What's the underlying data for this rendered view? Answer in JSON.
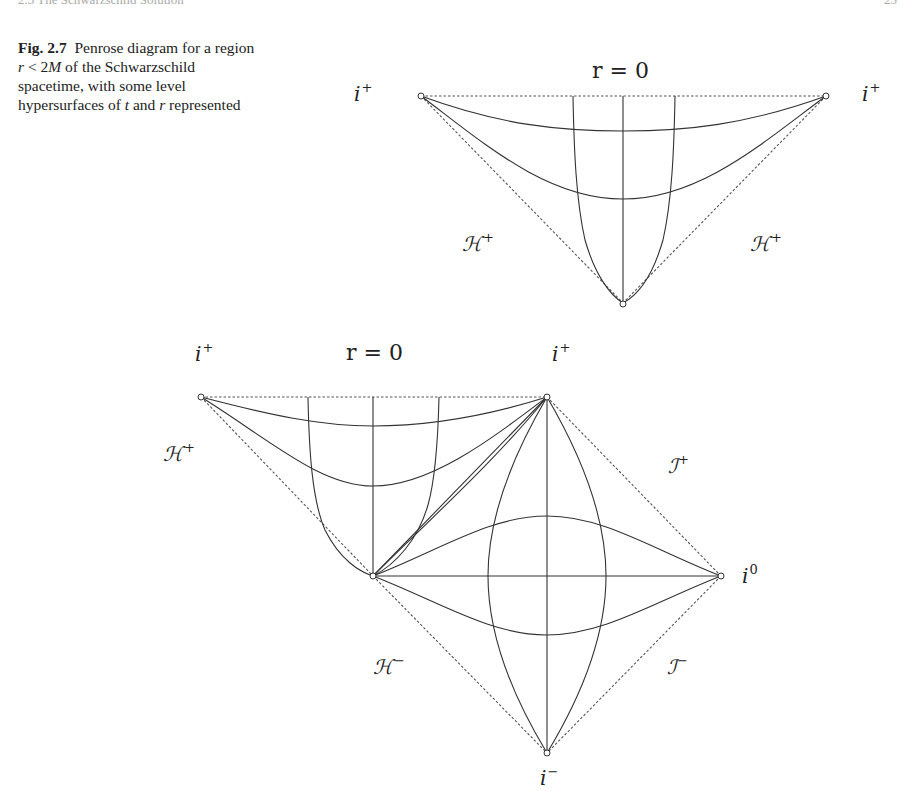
{
  "page": {
    "running_head": "2.3 The Schwarzschild Solution",
    "page_number": "25"
  },
  "caption": {
    "figure_label": "Fig. 2.7",
    "text_before_r": "Penrose diagram for a region ",
    "r": "r",
    "ineq": " < 2",
    "M": "M",
    "text_after": " of the Schwarzschild spacetime, with some level hypersurfaces of ",
    "t": "t",
    "and": " and ",
    "r2": "r",
    "end": " represented"
  },
  "top_diagram": {
    "label_singularity": "r = 0",
    "label_i_plus_left": "i",
    "label_i_plus_right": "i",
    "sup_plus": "+",
    "label_H_plus_left": "ℋ",
    "label_H_plus_right": "ℋ",
    "vertices": {
      "left": [
        421,
        96
      ],
      "right": [
        826,
        96
      ],
      "bottom": [
        623,
        303
      ]
    }
  },
  "bottom_diagram": {
    "label_i_plus_left": "i",
    "label_singularity": "r = 0",
    "label_i_plus_right": "i",
    "label_H_plus": "ℋ",
    "label_scri_plus": "ℐ",
    "label_i0": "i",
    "label_H_minus": "ℋ",
    "label_scri_minus": "ℐ",
    "label_i_minus": "i",
    "sup_plus": "+",
    "sup_minus": "−",
    "sup_zero": "0",
    "vertices": {
      "top_left": [
        201,
        397
      ],
      "top_right": [
        547,
        397
      ],
      "mid_left": [
        373,
        576
      ],
      "i0": [
        721,
        576
      ],
      "i_minus": [
        547,
        753
      ]
    }
  }
}
